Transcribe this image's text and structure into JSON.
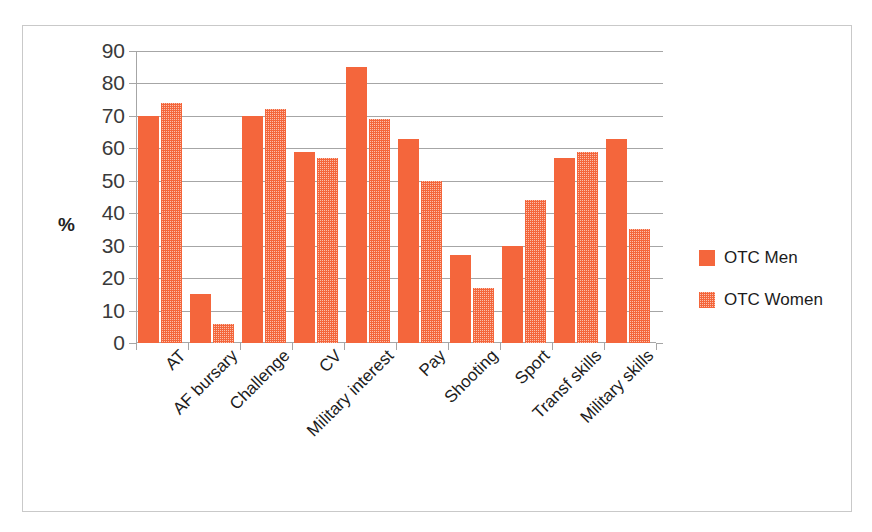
{
  "chart_data": {
    "type": "bar",
    "title": "",
    "xlabel": "",
    "ylabel": "%",
    "ylim": [
      0,
      90
    ],
    "ytick_step": 10,
    "yticks": [
      90,
      80,
      70,
      60,
      50,
      40,
      30,
      20,
      10,
      0
    ],
    "grid": true,
    "legend_position": "right",
    "categories": [
      "AT",
      "AF bursary",
      "Challenge",
      "CV",
      "Military interest",
      "Pay",
      "Shooting",
      "Sport",
      "Transf skills",
      "Military skills"
    ],
    "series": [
      {
        "name": "OTC Men",
        "color": "#F4663C",
        "fill": "solid",
        "values": [
          70,
          15,
          70,
          59,
          85,
          63,
          27,
          30,
          57,
          63
        ]
      },
      {
        "name": "OTC Women",
        "color": "#F4663C",
        "fill": "checkered",
        "values": [
          74,
          6,
          72,
          57,
          69,
          50,
          17,
          44,
          59,
          35
        ]
      }
    ]
  },
  "axis": {
    "y_title": "%"
  },
  "legend": {
    "items": [
      {
        "label": "OTC Men"
      },
      {
        "label": "OTC Women"
      }
    ]
  }
}
